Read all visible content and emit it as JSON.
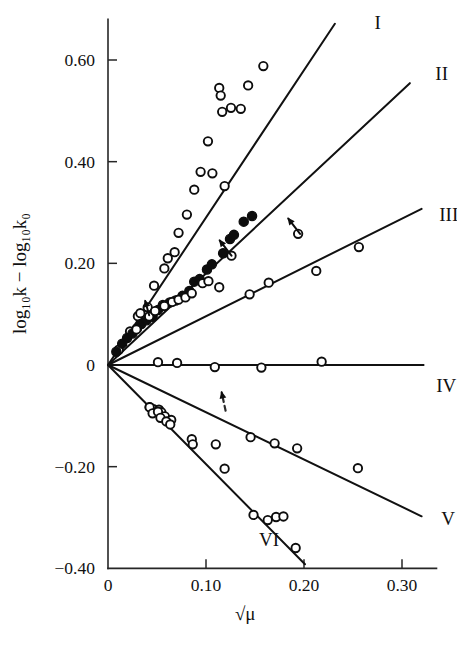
{
  "chart_data": {
    "type": "scatter",
    "title": "",
    "subtitle": "",
    "xlabel": "√μ",
    "ylabel": "log₁₀k − log₁₀k₀",
    "xlim": [
      0,
      0.325
    ],
    "ylim": [
      -0.4,
      0.68
    ],
    "grid": false,
    "legend_position": "line-end-labels",
    "xticks": [
      0,
      0.1,
      0.2,
      0.3
    ],
    "xticklabels": [
      "0",
      "0.10",
      "0.20",
      "0.30"
    ],
    "yticks": [
      0.6,
      0.4,
      0.2,
      0,
      -0.2,
      -0.4
    ],
    "yticklabels": [
      "0.60",
      "0.40",
      "0.20",
      "0",
      "−0.20",
      "−0.40"
    ],
    "annotations": [
      {
        "name": "arrow-lower-left-solid",
        "x": 0.126,
        "y": 0.215,
        "dx": -0.012,
        "dy": 0.03,
        "style": "solid"
      },
      {
        "name": "arrow-upper-right-solid",
        "x": 0.196,
        "y": 0.258,
        "dx": -0.012,
        "dy": 0.03,
        "style": "solid"
      },
      {
        "name": "arrow-near-origin-solid",
        "x": 0.042,
        "y": 0.098,
        "dx": -0.004,
        "dy": 0.028,
        "style": "solid"
      },
      {
        "name": "arrow-dashed-lower",
        "x": 0.12,
        "y": -0.09,
        "dx": -0.004,
        "dy": 0.036,
        "style": "dashed"
      }
    ],
    "series": [
      {
        "name": "I",
        "label": "I",
        "label_x": 0.272,
        "label_y": 0.672,
        "slope": 2.9,
        "line_x": [
          0,
          0.2315
        ],
        "marker": "open-circle",
        "points": [
          {
            "x": 0.011,
            "y": 0.03
          },
          {
            "x": 0.0225,
            "y": 0.066
          },
          {
            "x": 0.0305,
            "y": 0.096
          },
          {
            "x": 0.033,
            "y": 0.102
          },
          {
            "x": 0.0405,
            "y": 0.1135
          },
          {
            "x": 0.047,
            "y": 0.156
          },
          {
            "x": 0.0575,
            "y": 0.19
          },
          {
            "x": 0.061,
            "y": 0.21
          },
          {
            "x": 0.068,
            "y": 0.222
          },
          {
            "x": 0.072,
            "y": 0.26
          },
          {
            "x": 0.0805,
            "y": 0.296
          },
          {
            "x": 0.088,
            "y": 0.345
          },
          {
            "x": 0.0945,
            "y": 0.38
          },
          {
            "x": 0.1065,
            "y": 0.377
          },
          {
            "x": 0.102,
            "y": 0.44
          },
          {
            "x": 0.119,
            "y": 0.352
          },
          {
            "x": 0.1165,
            "y": 0.498
          },
          {
            "x": 0.1255,
            "y": 0.506
          },
          {
            "x": 0.1135,
            "y": 0.545
          },
          {
            "x": 0.115,
            "y": 0.53
          },
          {
            "x": 0.1355,
            "y": 0.504
          },
          {
            "x": 0.143,
            "y": 0.55
          },
          {
            "x": 0.1585,
            "y": 0.588
          }
        ]
      },
      {
        "name": "II",
        "label": "II",
        "label_x": 0.334,
        "label_y": 0.572,
        "slope": 1.8,
        "line_x": [
          0,
          0.308
        ],
        "marker": "filled-circle",
        "points": [
          {
            "x": 0.0085,
            "y": 0.026
          },
          {
            "x": 0.0145,
            "y": 0.042
          },
          {
            "x": 0.0195,
            "y": 0.053
          },
          {
            "x": 0.025,
            "y": 0.062
          },
          {
            "x": 0.0295,
            "y": 0.072
          },
          {
            "x": 0.034,
            "y": 0.0805
          },
          {
            "x": 0.0395,
            "y": 0.088
          },
          {
            "x": 0.0455,
            "y": 0.095
          },
          {
            "x": 0.051,
            "y": 0.108
          },
          {
            "x": 0.056,
            "y": 0.118
          },
          {
            "x": 0.063,
            "y": 0.123
          },
          {
            "x": 0.069,
            "y": 0.127
          },
          {
            "x": 0.076,
            "y": 0.136
          },
          {
            "x": 0.083,
            "y": 0.1455
          },
          {
            "x": 0.088,
            "y": 0.164
          },
          {
            "x": 0.0935,
            "y": 0.169
          },
          {
            "x": 0.101,
            "y": 0.188
          },
          {
            "x": 0.106,
            "y": 0.198
          },
          {
            "x": 0.1175,
            "y": 0.22
          },
          {
            "x": 0.1245,
            "y": 0.248
          },
          {
            "x": 0.1285,
            "y": 0.256
          },
          {
            "x": 0.1385,
            "y": 0.282
          },
          {
            "x": 0.147,
            "y": 0.293
          }
        ],
        "extra_open_points": [
          {
            "x": 0.029,
            "y": 0.07
          },
          {
            "x": 0.042,
            "y": 0.0955
          },
          {
            "x": 0.048,
            "y": 0.106
          },
          {
            "x": 0.0575,
            "y": 0.116
          },
          {
            "x": 0.0655,
            "y": 0.124
          },
          {
            "x": 0.072,
            "y": 0.1285
          },
          {
            "x": 0.079,
            "y": 0.133
          },
          {
            "x": 0.0855,
            "y": 0.141
          },
          {
            "x": 0.0965,
            "y": 0.161
          },
          {
            "x": 0.1025,
            "y": 0.165
          },
          {
            "x": 0.126,
            "y": 0.215
          },
          {
            "x": 0.194,
            "y": 0.258
          }
        ]
      },
      {
        "name": "III",
        "label": "III",
        "label_x": 0.338,
        "label_y": 0.296,
        "slope": 0.96,
        "line_x": [
          0,
          0.32
        ],
        "marker": "open-circle",
        "points": [
          {
            "x": 0.1135,
            "y": 0.153
          },
          {
            "x": 0.1445,
            "y": 0.139
          },
          {
            "x": 0.164,
            "y": 0.162
          },
          {
            "x": 0.2125,
            "y": 0.185
          },
          {
            "x": 0.256,
            "y": 0.232
          }
        ]
      },
      {
        "name": "IV",
        "label": "IV",
        "label_x": 0.335,
        "label_y": -0.042,
        "slope": 0.0,
        "line_x": [
          0,
          0.322
        ],
        "marker": "open-circle",
        "points": [
          {
            "x": 0.051,
            "y": 0.0055
          },
          {
            "x": 0.0705,
            "y": 0.004
          },
          {
            "x": 0.109,
            "y": -0.004
          },
          {
            "x": 0.1565,
            "y": -0.005
          },
          {
            "x": 0.218,
            "y": 0.0065
          }
        ]
      },
      {
        "name": "V",
        "label": "V",
        "label_x": 0.34,
        "label_y": -0.302,
        "slope": -0.93,
        "line_x": [
          0,
          0.32
        ],
        "marker": "open-circle",
        "points": [
          {
            "x": 0.0425,
            "y": -0.083
          },
          {
            "x": 0.0465,
            "y": -0.087
          },
          {
            "x": 0.052,
            "y": -0.088
          },
          {
            "x": 0.0545,
            "y": -0.093
          },
          {
            "x": 0.058,
            "y": -0.101
          },
          {
            "x": 0.0645,
            "y": -0.108
          },
          {
            "x": 0.0855,
            "y": -0.146
          },
          {
            "x": 0.11,
            "y": -0.156
          },
          {
            "x": 0.119,
            "y": -0.204
          },
          {
            "x": 0.1455,
            "y": -0.142
          },
          {
            "x": 0.17,
            "y": -0.154
          },
          {
            "x": 0.193,
            "y": -0.164
          },
          {
            "x": 0.255,
            "y": -0.203
          }
        ]
      },
      {
        "name": "VI",
        "label": "VI",
        "label_x": 0.154,
        "label_y": -0.345,
        "slope": -1.95,
        "line_x": [
          0,
          0.201
        ],
        "marker": "open-circle",
        "points": [
          {
            "x": 0.0425,
            "y": -0.083
          },
          {
            "x": 0.0455,
            "y": -0.095
          },
          {
            "x": 0.051,
            "y": -0.092
          },
          {
            "x": 0.0535,
            "y": -0.104
          },
          {
            "x": 0.0595,
            "y": -0.111
          },
          {
            "x": 0.0635,
            "y": -0.117
          },
          {
            "x": 0.0865,
            "y": -0.156
          },
          {
            "x": 0.1485,
            "y": -0.295
          },
          {
            "x": 0.163,
            "y": -0.305
          },
          {
            "x": 0.1715,
            "y": -0.299
          },
          {
            "x": 0.179,
            "y": -0.298
          },
          {
            "x": 0.1915,
            "y": -0.36
          }
        ]
      }
    ]
  }
}
